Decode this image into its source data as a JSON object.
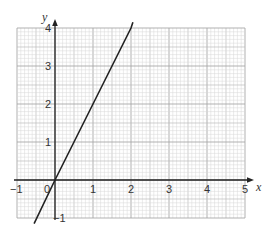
{
  "chart_data": {
    "type": "line",
    "title": "",
    "xlabel": "x",
    "ylabel": "y",
    "xlim": [
      -1,
      5
    ],
    "ylim": [
      -1,
      4
    ],
    "grid": true,
    "grid_minor_subdivisions": 10,
    "x_ticks": [
      -1,
      0,
      1,
      2,
      3,
      4,
      5
    ],
    "y_ticks": [
      -1,
      1,
      2,
      3,
      4
    ],
    "x_tick_labels": [
      "−1",
      "0",
      "1",
      "2",
      "3",
      "4",
      "5"
    ],
    "y_tick_labels": [
      "−1",
      "1",
      "2",
      "3",
      "4"
    ],
    "origin_label": "0",
    "series": [
      {
        "name": "y = 2x",
        "x": [
          -0.55,
          0,
          1,
          2,
          2.05
        ],
        "y": [
          -1.15,
          0,
          2,
          4,
          4.15
        ]
      }
    ],
    "legend": null
  },
  "colors": {
    "grid_minor": "#d9d9d9",
    "grid_mid": "#bcbcbc",
    "grid_major": "#a8a8a8",
    "axis": "#222222",
    "line": "#222222",
    "text": "#333333"
  }
}
